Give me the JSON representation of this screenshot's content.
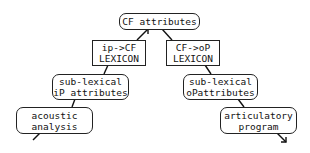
{
  "diagram": {
    "nodes": {
      "cf_attributes": {
        "lines": [
          "CF attributes"
        ]
      },
      "ip_cf_lexicon": {
        "lines": [
          "ip->CF",
          "LEXICON"
        ]
      },
      "cf_op_lexicon": {
        "lines": [
          "CF->oP",
          "LEXICON"
        ]
      },
      "sublex_ip": {
        "lines": [
          "sub-lexical",
          "iP attributes"
        ]
      },
      "sublex_op": {
        "lines": [
          "sub-lexical",
          "oPattributes"
        ]
      },
      "acoustic": {
        "lines": [
          "acoustic",
          "analysis"
        ]
      },
      "articulatory": {
        "lines": [
          "articulatory",
          "program"
        ]
      }
    },
    "edges": [
      {
        "from": "acoustic",
        "to": "sublex_ip"
      },
      {
        "from": "sublex_ip",
        "to": "ip_cf_lexicon"
      },
      {
        "from": "ip_cf_lexicon",
        "to": "cf_attributes",
        "arrow": true
      },
      {
        "from": "cf_attributes",
        "to": "cf_op_lexicon"
      },
      {
        "from": "cf_op_lexicon",
        "to": "sublex_op"
      },
      {
        "from": "sublex_op",
        "to": "articulatory"
      },
      {
        "from": "articulatory",
        "to": "output",
        "arrow": true
      }
    ]
  }
}
